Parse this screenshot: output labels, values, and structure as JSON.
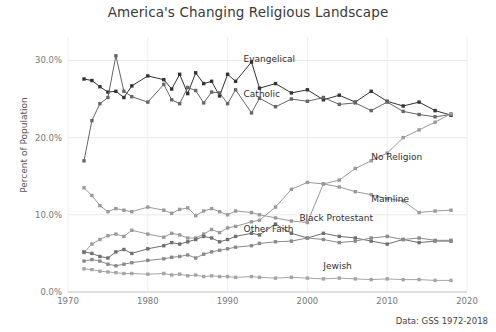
{
  "chart_data": {
    "type": "line",
    "title": "America's Changing Religious Landscape",
    "xlabel": "",
    "ylabel": "Percent of Population",
    "source_note": "Data: GSS 1972-2018",
    "xlim": [
      1970,
      2020
    ],
    "ylim": [
      0,
      32
    ],
    "xticks": [
      "1970",
      "1980",
      "1990",
      "2000",
      "2010",
      "2020"
    ],
    "xtick_values": [
      1970,
      1980,
      1990,
      2000,
      2010,
      2020
    ],
    "yticks": [
      "0.0%",
      "10.0%",
      "20.0%",
      "30.0%"
    ],
    "ytick_values": [
      0,
      10,
      20,
      30
    ],
    "grid": true,
    "legend": "inline-labels",
    "x": [
      1972,
      1973,
      1974,
      1975,
      1976,
      1977,
      1978,
      1980,
      1982,
      1983,
      1984,
      1985,
      1986,
      1987,
      1988,
      1989,
      1990,
      1991,
      1993,
      1994,
      1996,
      1998,
      2000,
      2002,
      2004,
      2006,
      2008,
      2010,
      2012,
      2014,
      2016,
      2018
    ],
    "series": [
      {
        "name": "Evangelical",
        "color": "#333333",
        "label_x": 1992,
        "label_y": 30.1,
        "values": [
          27.6,
          27.4,
          26.6,
          25.9,
          26.0,
          25.2,
          26.7,
          28.0,
          27.5,
          26.3,
          28.2,
          25.7,
          28.4,
          27.0,
          27.3,
          25.4,
          28.2,
          27.3,
          29.8,
          26.4,
          27.0,
          25.8,
          26.2,
          24.9,
          25.5,
          24.6,
          26.0,
          24.7,
          24.1,
          24.6,
          23.5,
          22.9
        ]
      },
      {
        "name": "Catholic",
        "color": "#666666",
        "label_x": 1992,
        "label_y": 25.5,
        "values": [
          17.0,
          22.2,
          24.4,
          25.2,
          30.6,
          26.0,
          25.3,
          24.6,
          26.9,
          24.9,
          24.4,
          26.5,
          26.1,
          24.5,
          25.9,
          25.8,
          24.4,
          26.2,
          23.2,
          25.1,
          24.0,
          25.0,
          24.7,
          25.2,
          24.3,
          24.5,
          23.5,
          24.6,
          23.4,
          23.0,
          22.7,
          23.0
        ]
      },
      {
        "name": "No Religion",
        "color": "#9a9a9a",
        "label_x": 2008,
        "label_y": 17.3,
        "values": [
          5.1,
          6.2,
          6.8,
          7.3,
          7.5,
          7.2,
          8.0,
          7.5,
          7.1,
          7.6,
          7.4,
          7.0,
          7.0,
          7.5,
          8.1,
          7.7,
          8.3,
          8.5,
          9.1,
          9.3,
          11.0,
          13.3,
          14.2,
          14.0,
          14.5,
          16.0,
          17.0,
          18.0,
          20.0,
          21.0,
          22.0,
          23.1
        ]
      },
      {
        "name": "Mainline",
        "color": "#9a9a9a",
        "label_x": 2008,
        "label_y": 11.9,
        "values": [
          13.5,
          12.5,
          11.2,
          10.4,
          10.8,
          10.6,
          10.4,
          11.0,
          10.6,
          10.2,
          10.7,
          10.9,
          9.9,
          10.5,
          10.8,
          10.4,
          10.0,
          10.5,
          10.3,
          10.0,
          9.6,
          9.2,
          9.0,
          14.0,
          13.6,
          13.0,
          12.6,
          12.1,
          11.8,
          10.3,
          10.5,
          10.6
        ]
      },
      {
        "name": "Black Protestant",
        "color": "#6f6f6f",
        "label_x": 1999,
        "label_y": 9.4,
        "values": [
          5.2,
          5.0,
          4.6,
          4.4,
          5.2,
          5.5,
          5.0,
          5.6,
          6.0,
          6.4,
          6.2,
          6.5,
          6.8,
          7.2,
          7.0,
          6.5,
          6.8,
          7.2,
          7.6,
          7.4,
          8.8,
          7.6,
          7.0,
          7.6,
          7.2,
          7.0,
          6.6,
          6.2,
          6.8,
          6.4,
          6.6,
          6.6
        ]
      },
      {
        "name": "Other Faith",
        "color": "#8a8a8a",
        "label_x": 1992,
        "label_y": 8.0,
        "values": [
          4.0,
          4.2,
          4.0,
          3.6,
          3.4,
          3.6,
          3.8,
          4.1,
          4.3,
          4.5,
          4.6,
          4.8,
          4.4,
          4.9,
          5.2,
          5.4,
          5.6,
          5.8,
          6.0,
          6.3,
          6.5,
          6.6,
          7.0,
          6.8,
          6.4,
          6.6,
          7.0,
          7.2,
          6.8,
          7.0,
          6.7,
          6.7
        ]
      },
      {
        "name": "Jewish",
        "color": "#a5a5a5",
        "label_x": 2002,
        "label_y": 3.2,
        "values": [
          3.0,
          2.9,
          2.7,
          2.6,
          2.5,
          2.4,
          2.4,
          2.3,
          2.4,
          2.2,
          2.3,
          2.1,
          2.2,
          2.0,
          2.1,
          2.0,
          2.0,
          1.9,
          2.0,
          1.9,
          1.8,
          1.9,
          1.8,
          1.7,
          1.8,
          1.7,
          1.6,
          1.7,
          1.6,
          1.6,
          1.5,
          1.5
        ]
      }
    ]
  }
}
